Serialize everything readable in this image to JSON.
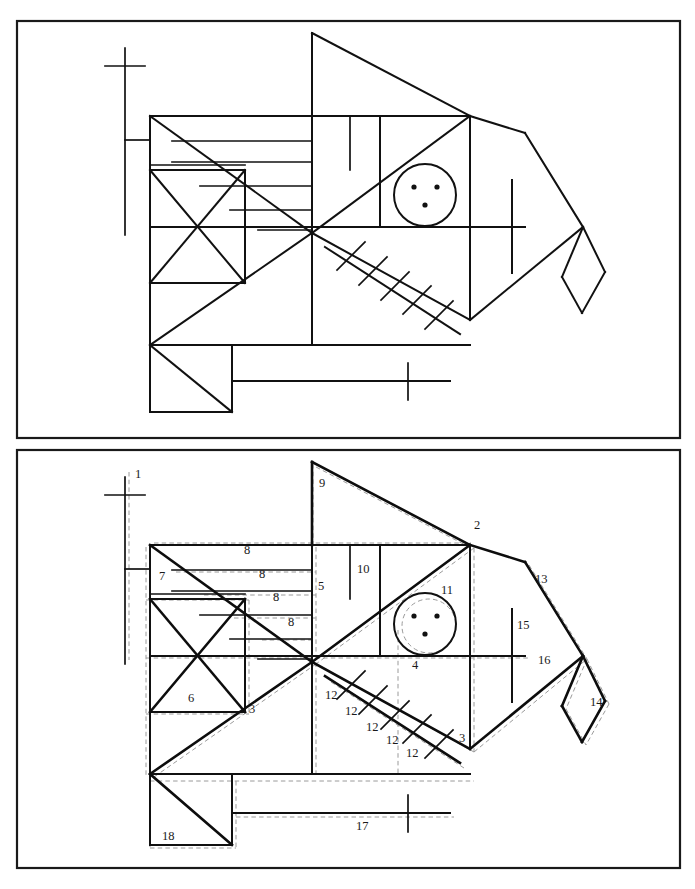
{
  "figure": {
    "panel_count": 2,
    "line_color": "#111111",
    "annotation_color": "#9a9a9a",
    "frame_color": "#1a1a1a",
    "background": "#ffffff"
  },
  "panels": {
    "top": {
      "name": "plain-construction",
      "caption": "",
      "has_annotations": false
    },
    "bottom": {
      "name": "annotated-construction",
      "caption": "",
      "has_annotations": true
    }
  },
  "eye": {
    "dot_count": 3,
    "label": "11"
  },
  "labels": [
    {
      "id": "l1",
      "text": "1",
      "x": 135,
      "y": 478
    },
    {
      "id": "l9",
      "text": "9",
      "x": 319,
      "y": 487
    },
    {
      "id": "l2",
      "text": "2",
      "x": 474,
      "y": 529
    },
    {
      "id": "l8a",
      "text": "8",
      "x": 244,
      "y": 554
    },
    {
      "id": "l7",
      "text": "7",
      "x": 159,
      "y": 580
    },
    {
      "id": "l8b",
      "text": "8",
      "x": 259,
      "y": 578
    },
    {
      "id": "l5",
      "text": "5",
      "x": 318,
      "y": 590
    },
    {
      "id": "l10",
      "text": "10",
      "x": 357,
      "y": 573
    },
    {
      "id": "l13",
      "text": "13",
      "x": 535,
      "y": 583
    },
    {
      "id": "l8c",
      "text": "8",
      "x": 273,
      "y": 601
    },
    {
      "id": "l11",
      "text": "11",
      "x": 441,
      "y": 594
    },
    {
      "id": "l15",
      "text": "15",
      "x": 517,
      "y": 629
    },
    {
      "id": "l8d",
      "text": "8",
      "x": 288,
      "y": 626
    },
    {
      "id": "l4",
      "text": "4",
      "x": 412,
      "y": 669
    },
    {
      "id": "l16",
      "text": "16",
      "x": 538,
      "y": 664
    },
    {
      "id": "l6",
      "text": "6",
      "x": 188,
      "y": 702
    },
    {
      "id": "l12a",
      "text": "12",
      "x": 325,
      "y": 699
    },
    {
      "id": "l14",
      "text": "14",
      "x": 590,
      "y": 706
    },
    {
      "id": "l3a",
      "text": "3",
      "x": 249,
      "y": 713
    },
    {
      "id": "l12b",
      "text": "12",
      "x": 345,
      "y": 715
    },
    {
      "id": "l12c",
      "text": "12",
      "x": 366,
      "y": 731
    },
    {
      "id": "l12d",
      "text": "12",
      "x": 386,
      "y": 744
    },
    {
      "id": "l3b",
      "text": "3",
      "x": 459,
      "y": 742
    },
    {
      "id": "l12e",
      "text": "12",
      "x": 406,
      "y": 757
    },
    {
      "id": "l17",
      "text": "17",
      "x": 356,
      "y": 830
    },
    {
      "id": "l18",
      "text": "18",
      "x": 162,
      "y": 840
    }
  ],
  "label_values": {
    "unique": [
      "1",
      "2",
      "3",
      "4",
      "5",
      "6",
      "7",
      "8",
      "9",
      "10",
      "11",
      "12",
      "13",
      "14",
      "15",
      "16",
      "17",
      "18"
    ],
    "repeated": {
      "8": 4,
      "12": 5,
      "3": 2
    }
  }
}
